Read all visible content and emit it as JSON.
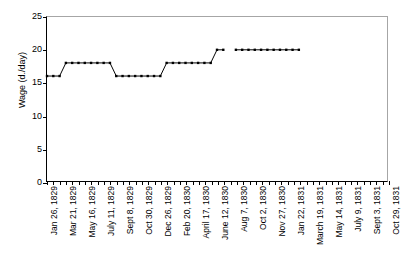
{
  "chart_data": {
    "type": "line",
    "title": "",
    "xlabel": "",
    "ylabel": "Wage (d./day)",
    "ylim": [
      0,
      25
    ],
    "yticks": [
      0,
      5,
      10,
      15,
      20,
      25
    ],
    "grid": false,
    "legend": false,
    "marker": "square",
    "marker_color": "#000000",
    "line_color": "#000000",
    "frame_color": "#a6a6a6",
    "axis_color": "#000000",
    "background": "#ffffff",
    "x_tick_labels": [
      "Jan 26, 1829",
      "Mar 21, 1829",
      "May 16, 1829",
      "July 11, 1829",
      "Sept 8, 1829",
      "Oct 30, 1829",
      "Dec 26, 1829",
      "Feb 20, 1830",
      "April 17, 1830",
      "June 12, 1830",
      "Aug 7, 1830",
      "Oct 2, 1830",
      "Nov 27, 1830",
      "Jan 22, 1831",
      "March 19, 1831",
      "May 14, 1831",
      "July 9, 1831",
      "Sept 3, 1831",
      "Oct 29, 1831"
    ],
    "x_label_every": 3,
    "n_points": 55,
    "series": [
      {
        "name": "Wage",
        "values": [
          16,
          16,
          16,
          18,
          18,
          18,
          18,
          18,
          18,
          18,
          18,
          16,
          16,
          16,
          16,
          16,
          16,
          16,
          16,
          18,
          18,
          18,
          18,
          18,
          18,
          18,
          18,
          20,
          20,
          null,
          20,
          20,
          20,
          20,
          20,
          20,
          20,
          20,
          20,
          20,
          20
        ]
      }
    ]
  }
}
